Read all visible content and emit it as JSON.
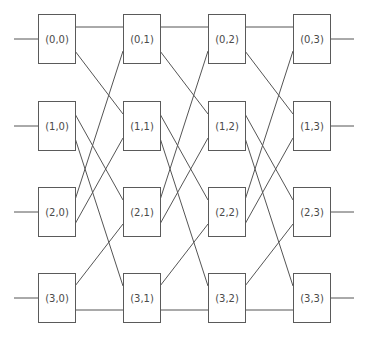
{
  "diagram": {
    "type": "omega-network",
    "rows": 4,
    "columns": 4,
    "colors": {
      "line": "#555555",
      "text": "#4a4a4a",
      "box_fill": "#ffffff",
      "box_stroke": "#5a5a5a"
    },
    "layout": {
      "col_x": [
        38,
        123,
        208,
        293
      ],
      "row_y": [
        14,
        101,
        187,
        273
      ],
      "box_w": 37,
      "box_h": 49,
      "port_upper_offset": 13,
      "port_lower_offset": 37,
      "stub_len": 24
    },
    "nodes": [
      [
        {
          "label": "(0,0)"
        },
        {
          "label": "(0,1)"
        },
        {
          "label": "(0,2)"
        },
        {
          "label": "(0,3)"
        }
      ],
      [
        {
          "label": "(1,0)"
        },
        {
          "label": "(1,1)"
        },
        {
          "label": "(1,2)"
        },
        {
          "label": "(1,3)"
        }
      ],
      [
        {
          "label": "(2,0)"
        },
        {
          "label": "(2,1)"
        },
        {
          "label": "(2,2)"
        },
        {
          "label": "(2,3)"
        }
      ],
      [
        {
          "label": "(3,0)"
        },
        {
          "label": "(3,1)"
        },
        {
          "label": "(3,2)"
        },
        {
          "label": "(3,3)"
        }
      ]
    ],
    "connections_between_stages": [
      {
        "from_row": 0,
        "from_port": "upper",
        "to_row": 0,
        "to_port": "upper"
      },
      {
        "from_row": 0,
        "from_port": "lower",
        "to_row": 1,
        "to_port": "upper"
      },
      {
        "from_row": 1,
        "from_port": "upper",
        "to_row": 2,
        "to_port": "upper"
      },
      {
        "from_row": 1,
        "from_port": "lower",
        "to_row": 3,
        "to_port": "upper"
      },
      {
        "from_row": 2,
        "from_port": "upper",
        "to_row": 0,
        "to_port": "lower"
      },
      {
        "from_row": 2,
        "from_port": "lower",
        "to_row": 1,
        "to_port": "lower"
      },
      {
        "from_row": 3,
        "from_port": "upper",
        "to_row": 2,
        "to_port": "lower"
      },
      {
        "from_row": 3,
        "from_port": "lower",
        "to_row": 3,
        "to_port": "lower"
      }
    ]
  }
}
